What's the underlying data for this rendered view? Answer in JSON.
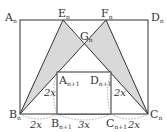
{
  "diagram": {
    "points": {
      "An": {
        "label": "A",
        "sub": "n",
        "x": 20,
        "y": 20
      },
      "Dn": {
        "label": "D",
        "sub": "n",
        "x": 148,
        "y": 20
      },
      "Bn": {
        "label": "B",
        "sub": "n",
        "x": 20,
        "y": 114
      },
      "Cn": {
        "label": "C",
        "sub": "n",
        "x": 148,
        "y": 114
      },
      "En": {
        "label": "E",
        "sub": "n",
        "x": 63,
        "y": 20
      },
      "Fn": {
        "label": "F",
        "sub": "n",
        "x": 106,
        "y": 20
      },
      "Gn": {
        "label": "G",
        "sub": "n",
        "x": 84,
        "y": 44
      },
      "An1": {
        "label": "A",
        "sub": "n+1",
        "x": 57,
        "y": 72
      },
      "Dn1": {
        "label": "D",
        "sub": "n+1",
        "x": 111,
        "y": 72
      },
      "Bn1": {
        "label": "B",
        "sub": "n+1",
        "x": 57,
        "y": 114
      },
      "Cn1": {
        "label": "C",
        "sub": "n+1",
        "x": 111,
        "y": 114
      }
    },
    "measurements": {
      "left_height": "2x",
      "right_height": "2x",
      "left_bottom": "2x",
      "middle_bottom": "3x",
      "right_bottom": "2x"
    },
    "colors": {
      "stroke": "#333333",
      "shade": "#d9d9d9",
      "dashed": "#888888"
    }
  }
}
